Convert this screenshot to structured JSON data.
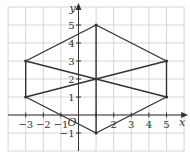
{
  "chart_data": {
    "type": "line",
    "title": "",
    "xlabel": "x",
    "ylabel": "y",
    "origin_label": "O",
    "xlim": [
      -4,
      6
    ],
    "ylim": [
      -2,
      6
    ],
    "grid": true,
    "x_ticks": [
      -3,
      -2,
      -1,
      2,
      3,
      4,
      5
    ],
    "x_tick_labels": [
      "−3",
      "−2",
      "−1",
      "2",
      "3",
      "4",
      "5"
    ],
    "y_ticks": [
      -1,
      1,
      2,
      3,
      4,
      5
    ],
    "y_tick_labels": [
      "−1",
      "1",
      "2",
      "3",
      "4",
      "5"
    ],
    "vertices": [
      {
        "x": 1,
        "y": 5
      },
      {
        "x": 5,
        "y": 3
      },
      {
        "x": 5,
        "y": 1
      },
      {
        "x": 1,
        "y": -1
      },
      {
        "x": -3,
        "y": 1
      },
      {
        "x": -3,
        "y": 3
      }
    ],
    "segments": [
      {
        "from": [
          1,
          5
        ],
        "to": [
          5,
          3
        ]
      },
      {
        "from": [
          5,
          3
        ],
        "to": [
          5,
          1
        ]
      },
      {
        "from": [
          5,
          1
        ],
        "to": [
          1,
          -1
        ]
      },
      {
        "from": [
          1,
          -1
        ],
        "to": [
          -3,
          1
        ]
      },
      {
        "from": [
          -3,
          1
        ],
        "to": [
          -3,
          3
        ]
      },
      {
        "from": [
          -3,
          3
        ],
        "to": [
          1,
          5
        ]
      },
      {
        "from": [
          1,
          5
        ],
        "to": [
          1,
          -1
        ]
      },
      {
        "from": [
          -3,
          3
        ],
        "to": [
          5,
          1
        ]
      },
      {
        "from": [
          -3,
          1
        ],
        "to": [
          5,
          3
        ]
      }
    ],
    "intersection": {
      "x": 1,
      "y": 2
    },
    "colors": {
      "grid": "#cccccc",
      "axis": "#333333",
      "shape": "#333333"
    }
  }
}
